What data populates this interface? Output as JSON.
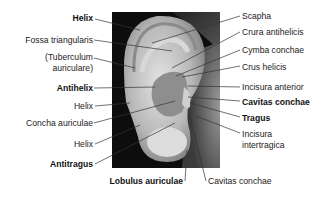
{
  "figure": {
    "image_alt": "Photograph of external human ear (auricle) with anatomical labels",
    "labels_left": [
      {
        "text": "Helix",
        "bold": true
      },
      {
        "text": "Fossa triangularis",
        "bold": false
      },
      {
        "text": "(Tuberculum",
        "bold": false
      },
      {
        "text": "auriculare)",
        "bold": false
      },
      {
        "text": "Antihelix",
        "bold": true
      },
      {
        "text": "Helix",
        "bold": false
      },
      {
        "text": "Concha auriculae",
        "bold": false
      },
      {
        "text": "Helix",
        "bold": false
      },
      {
        "text": "Antitragus",
        "bold": true
      }
    ],
    "labels_right": [
      {
        "text": "Scapha",
        "bold": false
      },
      {
        "text": "Crura antihelicis",
        "bold": false
      },
      {
        "text": "Cymba conchae",
        "bold": false
      },
      {
        "text": "Crus helicis",
        "bold": false
      },
      {
        "text": "Incisura anterior",
        "bold": false
      },
      {
        "text": "Cavitas conchae",
        "bold": true
      },
      {
        "text": "Tragus",
        "bold": true
      },
      {
        "text": "Incisura",
        "bold": false
      },
      {
        "text": "intertragica",
        "bold": false
      }
    ],
    "labels_bottom": [
      {
        "text": "Lobulus auriculae",
        "bold": true
      },
      {
        "text": "Cavitas conchae",
        "bold": false
      }
    ]
  }
}
